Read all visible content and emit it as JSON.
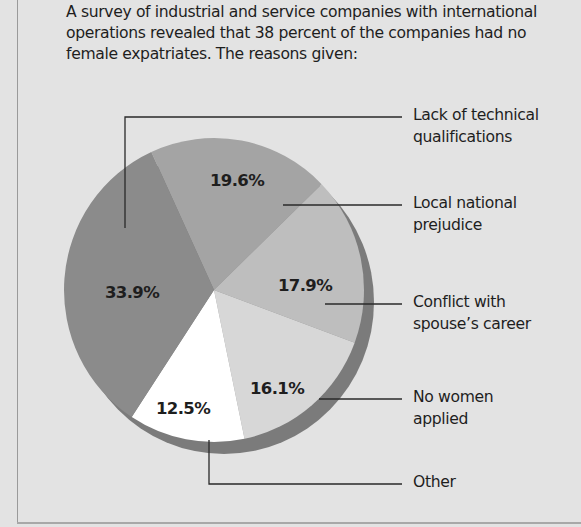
{
  "title": "A survey of industrial and service companies with international operations revealed that 38 percent of the companies had no female expatriates. The reasons given:",
  "title_lines": [
    "A survey of industrial and service companies with international",
    "operations revealed that 38 percent of the companies had no",
    "female expatriates. The reasons given:"
  ],
  "chart_data": {
    "type": "pie",
    "subtitle": "A survey of industrial and service companies with international operations revealed that 38 percent of the companies had no female expatriates. The reasons given:",
    "categories": [
      "Lack of technical qualifications",
      "Local national prejudice",
      "Conflict with spouse's career",
      "No women applied",
      "Other"
    ],
    "values": [
      33.9,
      19.6,
      17.9,
      16.1,
      12.5
    ],
    "value_labels": [
      "33.9%",
      "19.6%",
      "17.9%",
      "16.1%",
      "12.5%"
    ],
    "units": "percent",
    "legend_position": "right (leader lines)",
    "grid": false
  },
  "pie": {
    "cx": 214,
    "cy": 290,
    "rx": 150,
    "ry": 152,
    "shadow_dx": 10,
    "shadow_dy": 12,
    "shadow_color": "#7b7b7b",
    "order_start_deg": -24.7,
    "draw_order": [
      1,
      2,
      3,
      4,
      0
    ],
    "slices": [
      {
        "label": "33.9%",
        "value": 33.9,
        "color": "#8b8b8b",
        "label_x": 132,
        "label_y": 298
      },
      {
        "label": "19.6%",
        "value": 19.6,
        "color": "#a4a4a4",
        "label_x": 237,
        "label_y": 186
      },
      {
        "label": "17.9%",
        "value": 17.9,
        "color": "#bebebe",
        "label_x": 305,
        "label_y": 291
      },
      {
        "label": "16.1%",
        "value": 16.1,
        "color": "#d7d7d7",
        "label_x": 277,
        "label_y": 394
      },
      {
        "label": "12.5%",
        "value": 12.5,
        "color": "#ffffff",
        "label_x": 183,
        "label_y": 414
      }
    ]
  },
  "legend": [
    {
      "lines": [
        "Lack of technical",
        "qualifications"
      ],
      "top": 104,
      "path": "M125,228 L125,117 L402,117"
    },
    {
      "lines": [
        "Local national",
        "prejudice"
      ],
      "top": 192,
      "path": "M283,205 L402,205"
    },
    {
      "lines": [
        "Conflict with",
        "spouse’s career"
      ],
      "top": 291,
      "path": "M325,304 L402,304"
    },
    {
      "lines": [
        "No women",
        "applied"
      ],
      "top": 386,
      "path": "M319,399 L402,399"
    },
    {
      "lines": [
        "Other"
      ],
      "top": 471,
      "path": "M209,440 L209,484 L402,484"
    }
  ]
}
